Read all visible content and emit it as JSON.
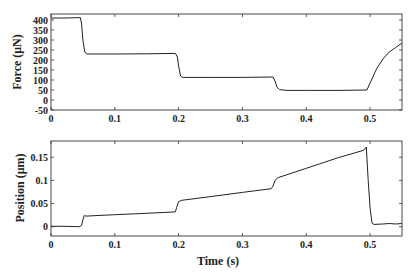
{
  "chart_data": [
    {
      "type": "line",
      "title": "",
      "xlabel": "",
      "ylabel": "Force (μN)",
      "xlim": [
        0,
        0.55
      ],
      "ylim": [
        -50,
        430
      ],
      "xticks": [
        0,
        0.1,
        0.2,
        0.3,
        0.4,
        0.5
      ],
      "xtick_labels": [
        "0",
        "0.1",
        "0.2",
        "0.3",
        "0.4",
        "0.5"
      ],
      "yticks": [
        -50,
        0,
        50,
        100,
        150,
        200,
        250,
        300,
        350,
        400
      ],
      "ytick_labels": [
        "-50",
        "0",
        "50",
        "100",
        "150",
        "200",
        "250",
        "300",
        "350",
        "400"
      ],
      "grid": false,
      "series": [
        {
          "name": "Force",
          "x": [
            0,
            0.02,
            0.046,
            0.048,
            0.05,
            0.053,
            0.056,
            0.1,
            0.15,
            0.195,
            0.198,
            0.2,
            0.203,
            0.206,
            0.25,
            0.3,
            0.348,
            0.351,
            0.354,
            0.358,
            0.37,
            0.4,
            0.45,
            0.495,
            0.5,
            0.51,
            0.52,
            0.53,
            0.54,
            0.55
          ],
          "y": [
            410,
            410,
            412,
            380,
            300,
            240,
            230,
            230,
            231,
            233,
            215,
            170,
            120,
            113,
            113,
            113,
            115,
            95,
            65,
            52,
            48,
            48,
            48,
            50,
            85,
            155,
            205,
            240,
            262,
            285
          ]
        }
      ]
    },
    {
      "type": "line",
      "title": "",
      "xlabel": "Time (s)",
      "ylabel": "Position (μm)",
      "xlim": [
        0,
        0.55
      ],
      "ylim": [
        -0.02,
        0.185
      ],
      "xticks": [
        0,
        0.1,
        0.2,
        0.3,
        0.4,
        0.5
      ],
      "xtick_labels": [
        "0",
        "0.1",
        "0.2",
        "0.3",
        "0.4",
        "0.5"
      ],
      "yticks": [
        0,
        0.05,
        0.1,
        0.15
      ],
      "ytick_labels": [
        "0",
        "0.05",
        "0.1",
        "0.15"
      ],
      "grid": false,
      "series": [
        {
          "name": "Position",
          "x": [
            0,
            0.02,
            0.045,
            0.048,
            0.05,
            0.052,
            0.055,
            0.1,
            0.15,
            0.195,
            0.197,
            0.2,
            0.205,
            0.25,
            0.3,
            0.345,
            0.348,
            0.351,
            0.356,
            0.4,
            0.45,
            0.49,
            0.494,
            0.497,
            0.5,
            0.503,
            0.506,
            0.52,
            0.53,
            0.54,
            0.55
          ],
          "y": [
            0.001,
            0.001,
            0.0,
            0.003,
            0.015,
            0.024,
            0.023,
            0.026,
            0.029,
            0.032,
            0.042,
            0.054,
            0.057,
            0.065,
            0.074,
            0.082,
            0.088,
            0.1,
            0.106,
            0.126,
            0.149,
            0.165,
            0.172,
            0.1,
            0.04,
            0.008,
            0.005,
            0.006,
            0.007,
            0.006,
            0.007
          ]
        }
      ]
    }
  ]
}
